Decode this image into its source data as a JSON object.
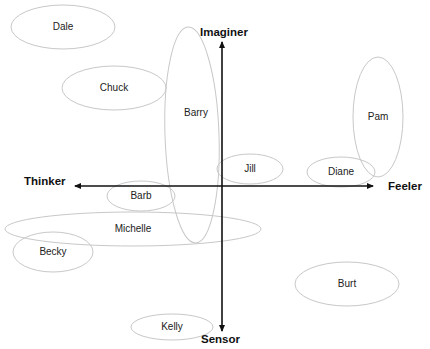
{
  "diagram": {
    "type": "quadrant-map",
    "axes": {
      "top": "Imaginer",
      "bottom": "Sensor",
      "left": "Thinker",
      "right": "Feeler"
    },
    "people": [
      {
        "name": "Dale",
        "cx": 63,
        "cy": 27,
        "rx": 52,
        "ry": 22,
        "rot": 0
      },
      {
        "name": "Chuck",
        "cx": 114,
        "cy": 88,
        "rx": 52,
        "ry": 22,
        "rot": 0
      },
      {
        "name": "Barry",
        "cx": 192,
        "cy": 135,
        "rx": 27,
        "ry": 108,
        "rot": -2
      },
      {
        "name": "Jill",
        "cx": 250,
        "cy": 169,
        "rx": 33,
        "ry": 15,
        "rot": 0
      },
      {
        "name": "Pam",
        "cx": 378,
        "cy": 117,
        "rx": 25,
        "ry": 60,
        "rot": 0
      },
      {
        "name": "Diane",
        "cx": 341,
        "cy": 172,
        "rx": 34,
        "ry": 15,
        "rot": 0
      },
      {
        "name": "Barb",
        "cx": 141,
        "cy": 196,
        "rx": 34,
        "ry": 15,
        "rot": 0
      },
      {
        "name": "Michelle",
        "cx": 133,
        "cy": 229,
        "rx": 128,
        "ry": 17,
        "rot": 0
      },
      {
        "name": "Becky",
        "cx": 53,
        "cy": 252,
        "rx": 40,
        "ry": 20,
        "rot": 0
      },
      {
        "name": "Burt",
        "cx": 347,
        "cy": 284,
        "rx": 52,
        "ry": 22,
        "rot": 0
      },
      {
        "name": "Kelly",
        "cx": 172,
        "cy": 327,
        "rx": 41,
        "ry": 13,
        "rot": 0
      }
    ]
  }
}
